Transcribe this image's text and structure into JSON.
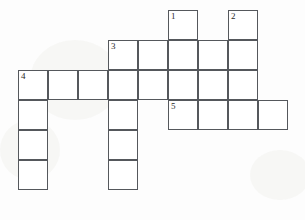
{
  "puzzle": {
    "title": "Crossword Grid",
    "cell_size": 30,
    "origin_x": 18,
    "origin_y": 10,
    "border_color": "#55585c",
    "cell_fill": "#ffffff",
    "page_background": "#fdfdfd",
    "number_color": "#2a2a2a",
    "columns": 9,
    "rows": 7,
    "cells": [
      {
        "name": "cell-r1c5",
        "col": 5,
        "row": 1,
        "number": "1"
      },
      {
        "name": "cell-r1c7",
        "col": 7,
        "row": 1,
        "number": "2"
      },
      {
        "name": "cell-r2c3",
        "col": 3,
        "row": 2,
        "number": "3"
      },
      {
        "name": "cell-r2c4",
        "col": 4,
        "row": 2,
        "number": ""
      },
      {
        "name": "cell-r2c5",
        "col": 5,
        "row": 2,
        "number": ""
      },
      {
        "name": "cell-r2c6",
        "col": 6,
        "row": 2,
        "number": ""
      },
      {
        "name": "cell-r2c7",
        "col": 7,
        "row": 2,
        "number": ""
      },
      {
        "name": "cell-r3c0",
        "col": 0,
        "row": 3,
        "number": "4"
      },
      {
        "name": "cell-r3c1",
        "col": 1,
        "row": 3,
        "number": ""
      },
      {
        "name": "cell-r3c2",
        "col": 2,
        "row": 3,
        "number": ""
      },
      {
        "name": "cell-r3c3",
        "col": 3,
        "row": 3,
        "number": ""
      },
      {
        "name": "cell-r3c4",
        "col": 4,
        "row": 3,
        "number": ""
      },
      {
        "name": "cell-r3c5",
        "col": 5,
        "row": 3,
        "number": ""
      },
      {
        "name": "cell-r3c6",
        "col": 6,
        "row": 3,
        "number": ""
      },
      {
        "name": "cell-r3c7",
        "col": 7,
        "row": 3,
        "number": ""
      },
      {
        "name": "cell-r4c0",
        "col": 0,
        "row": 4,
        "number": ""
      },
      {
        "name": "cell-r4c3",
        "col": 3,
        "row": 4,
        "number": ""
      },
      {
        "name": "cell-r4c5",
        "col": 5,
        "row": 4,
        "number": "5"
      },
      {
        "name": "cell-r4c6",
        "col": 6,
        "row": 4,
        "number": ""
      },
      {
        "name": "cell-r4c7",
        "col": 7,
        "row": 4,
        "number": ""
      },
      {
        "name": "cell-r4c8",
        "col": 8,
        "row": 4,
        "number": ""
      },
      {
        "name": "cell-r5c0",
        "col": 0,
        "row": 5,
        "number": ""
      },
      {
        "name": "cell-r5c3",
        "col": 3,
        "row": 5,
        "number": ""
      },
      {
        "name": "cell-r6c0",
        "col": 0,
        "row": 6,
        "number": ""
      },
      {
        "name": "cell-r6c3",
        "col": 3,
        "row": 6,
        "number": ""
      }
    ],
    "clue_numbers": [
      "1",
      "2",
      "3",
      "4",
      "5"
    ]
  }
}
